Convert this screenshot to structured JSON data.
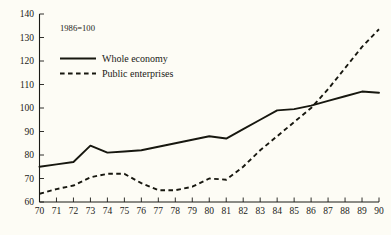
{
  "chart_data": {
    "type": "line",
    "title": "",
    "subtitle": "",
    "note": "1986=100",
    "xlabel": "",
    "ylabel": "",
    "xlim": [
      70,
      90
    ],
    "ylim": [
      60,
      140
    ],
    "grid": false,
    "legend_position": "top-left",
    "x": [
      70,
      71,
      72,
      73,
      74,
      75,
      76,
      77,
      78,
      79,
      80,
      81,
      82,
      83,
      84,
      85,
      86,
      87,
      88,
      89,
      90
    ],
    "xtick_labels": [
      "70",
      "71",
      "72",
      "73",
      "74",
      "75",
      "76",
      "77",
      "78",
      "79",
      "80",
      "81",
      "82",
      "83",
      "84",
      "85",
      "86",
      "87",
      "88",
      "89",
      "90"
    ],
    "ytick_labels": [
      "60",
      "70",
      "80",
      "90",
      "100",
      "110",
      "120",
      "130",
      "140"
    ],
    "yticks": [
      60,
      70,
      80,
      90,
      100,
      110,
      120,
      130,
      140
    ],
    "series": [
      {
        "name": "Whole economy",
        "style": "solid",
        "color": "#17170f",
        "values": [
          75.0,
          76.0,
          77.0,
          84.0,
          81.0,
          81.5,
          82.0,
          83.5,
          85.0,
          86.5,
          88.0,
          87.0,
          91.0,
          95.0,
          99.0,
          99.5,
          101.0,
          103.0,
          105.0,
          107.0,
          106.5
        ]
      },
      {
        "name": "Public enterprises",
        "style": "dashed",
        "color": "#17170f",
        "values": [
          63.5,
          65.5,
          67.0,
          70.5,
          72.0,
          72.0,
          68.0,
          65.0,
          65.0,
          66.5,
          70.0,
          69.5,
          75.0,
          82.0,
          88.0,
          94.0,
          100.0,
          108.0,
          117.0,
          126.0,
          133.5
        ]
      }
    ]
  },
  "legend": {
    "entries": [
      {
        "label": "Whole economy",
        "style": "solid"
      },
      {
        "label": "Public enterprises",
        "style": "dashed"
      }
    ]
  }
}
